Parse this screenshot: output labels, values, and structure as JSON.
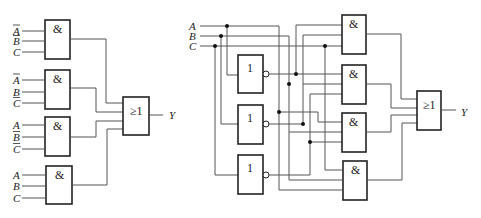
{
  "left_circuit": {
    "and_gates": [
      {
        "symbol": "&",
        "inputs": [
          "A",
          "B",
          "C"
        ],
        "inverted": [
          true,
          true,
          false
        ]
      },
      {
        "symbol": "&",
        "inputs": [
          "A",
          "B",
          "C"
        ],
        "inverted": [
          true,
          false,
          true
        ]
      },
      {
        "symbol": "&",
        "inputs": [
          "A",
          "B",
          "C"
        ],
        "inverted": [
          false,
          true,
          true
        ]
      },
      {
        "symbol": "&",
        "inputs": [
          "A",
          "B",
          "C"
        ],
        "inverted": [
          false,
          false,
          false
        ]
      }
    ],
    "or_gate": {
      "symbol": "≥1"
    },
    "output": "Y"
  },
  "right_circuit": {
    "inputs": [
      "A",
      "B",
      "C"
    ],
    "not_gates": [
      {
        "symbol": "1",
        "input": "A"
      },
      {
        "symbol": "1",
        "input": "B"
      },
      {
        "symbol": "1",
        "input": "C"
      }
    ],
    "and_gates": [
      {
        "symbol": "&"
      },
      {
        "symbol": "&"
      },
      {
        "symbol": "&"
      },
      {
        "symbol": "&"
      }
    ],
    "or_gate": {
      "symbol": "≥1"
    },
    "output": "Y"
  }
}
